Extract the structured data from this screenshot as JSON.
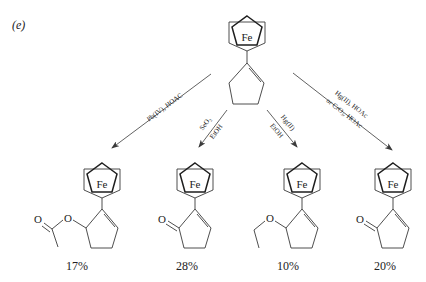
{
  "figure_label": "(e)",
  "starting_material": {
    "name": "1-ferrocenylcyclopentene",
    "metal": "Fe"
  },
  "reactions": [
    {
      "id": "pb",
      "conditions_line1": "Pb(IV), HOAC",
      "conditions_line2": "",
      "product": "2-ferrocenyl-cyclopent-2-enyl acetate",
      "product_metal": "Fe",
      "substituent_atom": "O",
      "carbonyl_atom": "O",
      "yield": "17%"
    },
    {
      "id": "se",
      "conditions_line1": "SeO₂",
      "conditions_line2": "EtOH",
      "product": "2-ferrocenylcyclopent-2-enone",
      "product_metal": "Fe",
      "carbonyl_atom": "O",
      "yield": "28%"
    },
    {
      "id": "hg",
      "conditions_line1": "Hg(II)",
      "conditions_line2": "EtOH",
      "product": "1-(5-ethoxycyclopent-1-enyl)ferrocene",
      "product_metal": "Fe",
      "substituent_atom": "O",
      "yield": "10%"
    },
    {
      "id": "hgcr",
      "conditions_line1": "Hg(II), HOAc",
      "conditions_line2": "or CrO₃, HOAc",
      "product": "2-ferrocenylcyclopent-2-enone",
      "product_metal": "Fe",
      "carbonyl_atom": "O",
      "yield": "20%"
    }
  ]
}
